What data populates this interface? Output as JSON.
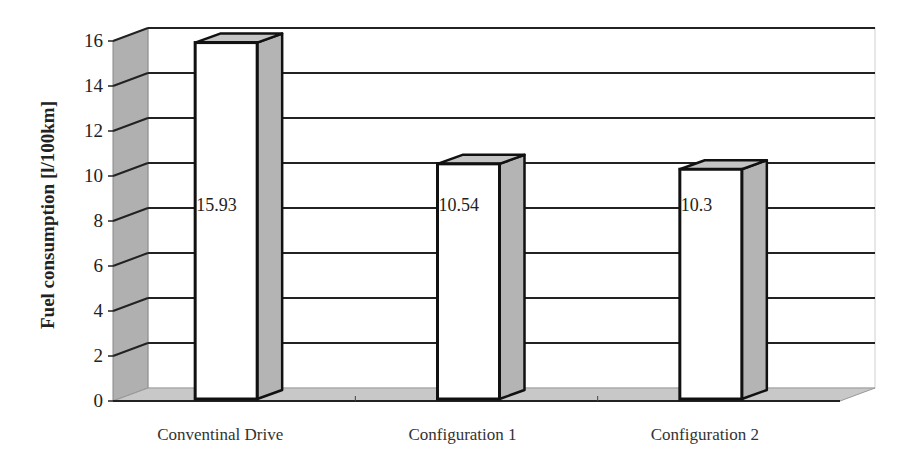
{
  "chart_data": {
    "type": "bar",
    "style": "3d-column",
    "title": "",
    "xlabel": "",
    "ylabel": "Fuel consumption [l/100km]",
    "categories": [
      "Conventinal Drive",
      "Configuration 1",
      "Configuration 2"
    ],
    "values": [
      15.93,
      10.54,
      10.3
    ],
    "data_labels": [
      "15.93",
      "10.54",
      "10.3"
    ],
    "ylim": [
      0,
      16
    ],
    "yticks": [
      0,
      2,
      4,
      6,
      8,
      10,
      12,
      14,
      16
    ],
    "ytick_labels": [
      "0",
      "2",
      "4",
      "6",
      "8",
      "10",
      "12",
      "14",
      "16"
    ],
    "grid": true,
    "legend": null
  },
  "colors": {
    "bar_front": "#ffffff",
    "bar_side": "#b4b4b4",
    "wall": "#b0b0b0",
    "floor": "#c8c8c8",
    "gridline": "#222222",
    "outline": "#111111"
  }
}
